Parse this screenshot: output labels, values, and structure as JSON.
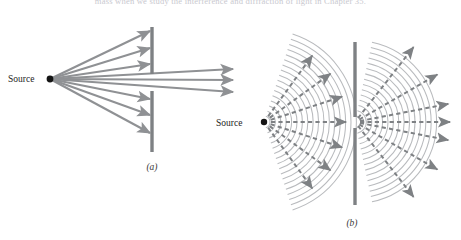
{
  "figure": {
    "cut_off_header_text": "mass when we study the interference and diffraction of light in Chapter 35.",
    "background_color": "#ffffff",
    "ray_color": "#8f9194",
    "wavefront_color": "#b9bbbe",
    "barrier_color": "#7e8184",
    "source_dot_color": "#141414",
    "label_color": "#3a3a3a",
    "panels": [
      {
        "id": "a",
        "label": "(a)",
        "label_x": 152,
        "label_y": 170,
        "source_label": "Source",
        "source_label_x": 8,
        "source_label_y": 82,
        "source_x": 50,
        "source_y": 79,
        "barrier_x": 152,
        "barrier_top_y": 27,
        "barrier_top_end_y": 74,
        "barrier_bottom_y": 91,
        "barrier_bottom_end_y": 152,
        "slit_top_y": 74,
        "slit_bottom_y": 91,
        "blocked_rays": [
          {
            "end_x": 150,
            "end_y": 31
          },
          {
            "end_x": 150,
            "end_y": 48
          },
          {
            "end_x": 150,
            "end_y": 64
          },
          {
            "end_x": 150,
            "end_y": 99
          },
          {
            "end_x": 150,
            "end_y": 115
          },
          {
            "end_x": 150,
            "end_y": 133
          }
        ],
        "through_rays": [
          {
            "end_x": 233,
            "end_y": 69
          },
          {
            "end_x": 233,
            "end_y": 80
          },
          {
            "end_x": 233,
            "end_y": 92
          }
        ],
        "description": "Straight rays from point source; most blocked by barrier, three pass through slit and travel straight on"
      },
      {
        "id": "b",
        "label": "(b)",
        "label_x": 352,
        "label_y": 226,
        "source_label": "Source",
        "source_label_x": 216,
        "source_label_y": 126,
        "source_x": 264,
        "source_y": 122,
        "barrier_x": 355,
        "barrier_top_y": 42,
        "barrier_top_end_y": 117,
        "barrier_bottom_y": 128,
        "barrier_bottom_end_y": 205,
        "slit_top_y": 117,
        "slit_bottom_y": 128,
        "slit_center_x": 355,
        "slit_center_y": 122,
        "left_wavefront_count": 17,
        "left_wavefront_spacing": 5.4,
        "left_wavefront_first_radius": 6,
        "left_wavefront_half_angle_deg": 72,
        "right_wavefront_count": 15,
        "right_wavefront_spacing": 5.4,
        "right_wavefront_first_radius": 6,
        "right_wavefront_half_angle_deg": 78,
        "left_dashed_arrow_angles_deg": [
          -54,
          -36,
          -18,
          0,
          18,
          36,
          54
        ],
        "left_dashed_arrow_length": 82,
        "right_dashed_arrow_angles_deg": [
          -52,
          -30,
          -11,
          0,
          11,
          30,
          52
        ],
        "right_dashed_arrow_length": 95,
        "description": "Circular wavefronts from point source reach barrier; slit acts as new point source producing circular diffracted wavefronts with rays fanning out widely"
      }
    ]
  }
}
